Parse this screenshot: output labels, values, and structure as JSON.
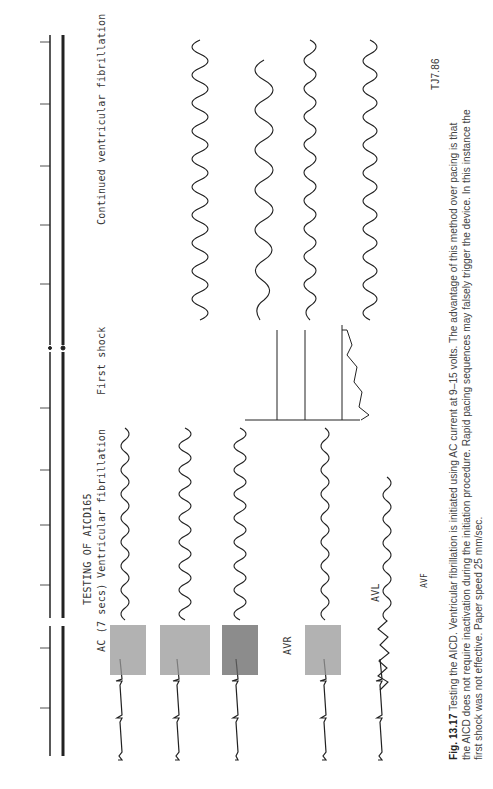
{
  "figure": {
    "caption_label": "Fig. 13.17",
    "caption_lines": [
      " Testing the AICD. Ventricular fibrillation is initiated using AC current at 9–15 volts. The advantage of this method over pacing is that",
      "the AICD does not require inactivation during the initiation procedure. Rapid pacing sequences may falsely trigger the device. In this instance the",
      "first shock was not effective. Paper speed 25 mm/sec."
    ],
    "signature": "TJ7.86",
    "page_marker": "165"
  },
  "annotations": {
    "title": "TESTING OF AICD",
    "ac_label": "AC  (7 secs)",
    "vf_label": "Ventricular fibrillation",
    "first_shock": "First shock",
    "continued": "Continued ventricular fibrillation"
  },
  "leads": [
    {
      "name": "I",
      "label": ""
    },
    {
      "name": "II",
      "label": ""
    },
    {
      "name": "III",
      "label": ""
    },
    {
      "name": "AVR",
      "label": "AVR"
    },
    {
      "name": "AVL",
      "label": "AVL"
    },
    {
      "name": "AVF",
      "label": "AVF"
    }
  ],
  "colors": {
    "ink": "#222222",
    "paper": "#ffffff",
    "caption": "#444444"
  }
}
